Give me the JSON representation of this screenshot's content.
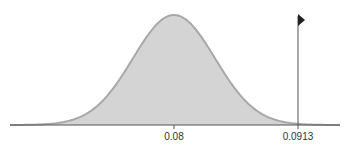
{
  "chart_data": {
    "type": "area",
    "title": "",
    "xlabel": "",
    "ylabel": "",
    "tick_labels": [
      "0.08",
      "0.0913"
    ],
    "mean": 0.08,
    "critical_value": 0.0913,
    "shaded_region": "right tail beyond 0.0913",
    "grid": false,
    "legend": null
  },
  "axis": {
    "tick_mean": "0.08",
    "tick_critical": "0.0913"
  },
  "colors": {
    "fill": "#d4d4d4",
    "curve": "#a8a8a8",
    "tail": "#7a7a7a",
    "axis": "#555555",
    "marker": "#222222"
  }
}
